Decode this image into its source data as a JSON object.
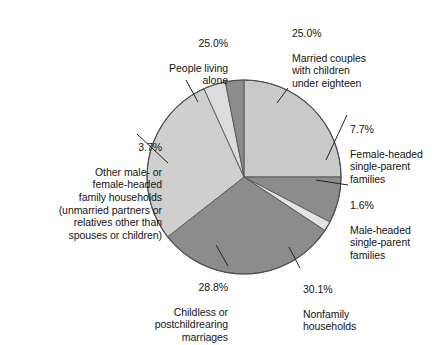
{
  "chart_data": {
    "type": "pie",
    "title": "",
    "subtitle": "",
    "xlabel": "",
    "ylabel": "",
    "legend_position": "none",
    "grid": false,
    "labels_outside": true,
    "total": 100.0,
    "categories": [
      "Married couples with children under eighteen",
      "Female-headed single-parent families",
      "Male-headed single-parent families",
      "Nonfamily households",
      "Childless or postchildrearing marriages",
      "Other male- or female-headed family households (unmarried partners or relatives other than spouses or children)",
      "People living alone"
    ],
    "values": [
      25.0,
      7.7,
      1.6,
      30.1,
      28.8,
      3.7,
      25.0
    ],
    "slices": [
      {
        "id": "married",
        "percent_text": "25.0%",
        "value": 25.0,
        "name_text": "Married couples\nwith children\nunder eighteen",
        "color": "#c9c9c9",
        "start_angle": 0.0,
        "end_angle": 90.0
      },
      {
        "id": "female-headed",
        "percent_text": "7.7%",
        "value": 7.7,
        "name_text": "Female-headed\nsingle-parent\nfamilies",
        "color": "#8c8c8c",
        "start_angle": 90.0,
        "end_angle": 117.7
      },
      {
        "id": "male-headed",
        "percent_text": "1.6%",
        "value": 1.6,
        "name_text": "Male-headed\nsingle-parent\nfamilies",
        "color": "#e4e4e4",
        "start_angle": 117.7,
        "end_angle": 123.5
      },
      {
        "id": "nonfamily",
        "percent_text": "30.1%",
        "value": 30.1,
        "name_text": "Nonfamily\nhouseholds",
        "color": "#8c8c8c",
        "start_angle": 123.5,
        "end_angle": 231.9
      },
      {
        "id": "childless",
        "percent_text": "28.8%",
        "value": 28.8,
        "name_text": "Childless or\npostchildrearing\nmarriages",
        "color": "#cfcfcf",
        "start_angle": 231.9,
        "end_angle": 335.6
      },
      {
        "id": "other-family",
        "percent_text": "3.7%",
        "value": 3.7,
        "name_text": "Other male- or\nfemale-headed\nfamily households\n(unmarried partners or\nrelatives other than\nspouses or children)",
        "color": "#dcdcdc",
        "start_angle": 335.6,
        "end_angle": 348.9
      },
      {
        "id": "living-alone",
        "percent_text": "25.0%",
        "value": 25.0,
        "name_text": "People living\nalone",
        "color": "#8c8c8c",
        "start_angle": 348.9,
        "end_angle": 360.0
      }
    ],
    "colors": {
      "dark_gray": "#8c8c8c",
      "light_gray": "#c9c9c9",
      "pale_gray": "#dcdcdc",
      "outline": "#4d4d4d",
      "background": "#ffffff",
      "text": "#141414"
    },
    "geometry": {
      "center_x": 244,
      "center_y": 177,
      "radius": 97
    }
  }
}
